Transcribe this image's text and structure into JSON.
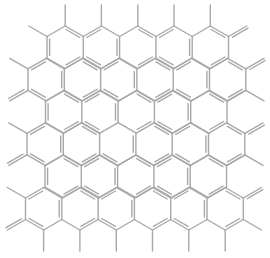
{
  "diagram": {
    "type": "chemical-structure",
    "bond_color": "#a8a8a8",
    "bond_width": 1.4,
    "double_bond_offset": 2.6,
    "lattice": {
      "hex_width": 36.3,
      "side": 21.5,
      "row_pitch": 32.3,
      "first_row_top_y": 26,
      "rows": [
        {
          "row": 1,
          "hex_count": 5,
          "left_x": 47
        },
        {
          "row": 2,
          "hex_count": 6,
          "left_x": 28
        },
        {
          "row": 3,
          "hex_count": 5,
          "left_x": 45.5
        },
        {
          "row": 4,
          "hex_count": 6,
          "left_x": 27
        },
        {
          "row": 5,
          "hex_count": 5,
          "left_x": 45
        },
        {
          "row": 6,
          "hex_count": 6,
          "left_x": 25.5
        }
      ]
    },
    "substituents": {
      "top_methyls_from_row1_tops": true,
      "bottom_methyls_from_row6_bottoms": true,
      "left_side": [
        {
          "row": 1,
          "vertex": "upper-left",
          "kind": "single"
        },
        {
          "row": 2,
          "vertex": "upper-left",
          "kind": "single"
        },
        {
          "row": 2,
          "vertex": "lower-left",
          "kind": "double"
        },
        {
          "row": 4,
          "vertex": "upper-left",
          "kind": "single"
        },
        {
          "row": 4,
          "vertex": "lower-left",
          "kind": "double"
        },
        {
          "row": 6,
          "vertex": "upper-left",
          "kind": "single"
        },
        {
          "row": 6,
          "vertex": "lower-left",
          "kind": "double"
        }
      ],
      "right_side": [
        {
          "row": 1,
          "vertex": "upper-right",
          "kind": "double"
        },
        {
          "row": 2,
          "vertex": "upper-right",
          "kind": "double"
        },
        {
          "row": 2,
          "vertex": "lower-right",
          "kind": "single"
        },
        {
          "row": 3,
          "vertex": "upper-right",
          "kind": "single"
        },
        {
          "row": 4,
          "vertex": "upper-right",
          "kind": "double"
        },
        {
          "row": 4,
          "vertex": "lower-right",
          "kind": "single"
        },
        {
          "row": 5,
          "vertex": "upper-right",
          "kind": "single"
        },
        {
          "row": 6,
          "vertex": "upper-right",
          "kind": "double"
        },
        {
          "row": 6,
          "vertex": "lower-right",
          "kind": "single"
        }
      ]
    }
  }
}
